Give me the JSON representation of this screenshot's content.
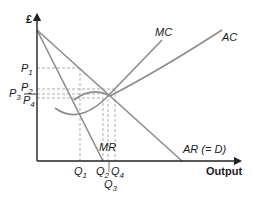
{
  "diagram": {
    "type": "monopoly cost and revenue diagram",
    "y_axis_label": "£",
    "x_axis_label": "Output",
    "curves": [
      {
        "id": "mc",
        "label": "MC"
      },
      {
        "id": "ac",
        "label": "AC"
      },
      {
        "id": "ar",
        "label": "AR (= D)"
      },
      {
        "id": "mr",
        "label": "MR"
      }
    ],
    "price_levels": [
      {
        "id": "p1",
        "label": "P",
        "sub": "1"
      },
      {
        "id": "p2",
        "label": "P",
        "sub": "2"
      },
      {
        "id": "p3",
        "label": "P",
        "sub": "3"
      },
      {
        "id": "p4",
        "label": "P",
        "sub": "4"
      }
    ],
    "quantity_levels": [
      {
        "id": "q1",
        "label": "Q",
        "sub": "1"
      },
      {
        "id": "q2",
        "label": "Q",
        "sub": "2"
      },
      {
        "id": "q3",
        "label": "Q",
        "sub": "3"
      },
      {
        "id": "q4",
        "label": "Q",
        "sub": "4"
      }
    ],
    "colors": {
      "axis": "#222222",
      "curve": "#8c8c8c",
      "guide": "#a6a6a6"
    }
  }
}
